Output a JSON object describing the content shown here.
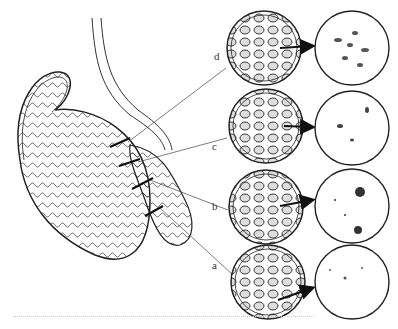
{
  "figure": {
    "labels": [
      {
        "id": "d",
        "text": "d",
        "x": 214,
        "y": 58
      },
      {
        "id": "c",
        "text": "c",
        "x": 212,
        "y": 148
      },
      {
        "id": "b",
        "text": "b",
        "x": 212,
        "y": 207
      },
      {
        "id": "a",
        "text": "a",
        "x": 212,
        "y": 266
      }
    ],
    "sections": [
      {
        "label": "d",
        "tubule_cx": 264,
        "tubule_cy": 48,
        "lumen_cx": 352,
        "lumen_cy": 48,
        "lumen_content": "dense sperm"
      },
      {
        "label": "c",
        "tubule_cx": 266,
        "tubule_cy": 126,
        "lumen_cx": 352,
        "lumen_cy": 128,
        "lumen_content": "sparse sperm"
      },
      {
        "label": "b",
        "tubule_cx": 266,
        "tubule_cy": 207,
        "lumen_cx": 352,
        "lumen_cy": 206,
        "lumen_content": "cell debris"
      },
      {
        "label": "a",
        "tubule_cx": 268,
        "tubule_cy": 282,
        "lumen_cx": 352,
        "lumen_cy": 282,
        "lumen_content": "few particles"
      }
    ],
    "colors": {
      "ink": "#222222",
      "background": "#ffffff"
    }
  }
}
